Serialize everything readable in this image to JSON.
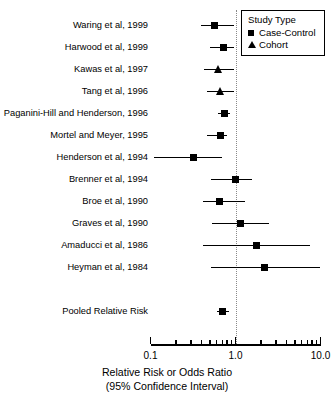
{
  "chart_data": {
    "type": "scatter",
    "plot_kind": "forest-plot",
    "title": "",
    "xlabel": "Relative Risk or Odds Ratio",
    "xlabel_sub": "(95% Confidence Interval)",
    "ylabel": "",
    "xscale": "log",
    "xlim": [
      0.1,
      10.0
    ],
    "grid": false,
    "reference_line": 1.0,
    "tick_labels": [
      "0.1",
      "1.0",
      "10.0"
    ],
    "tick_values": [
      0.1,
      1.0,
      10.0
    ],
    "minor_tick_values": [
      0.2,
      0.3,
      0.4,
      0.5,
      0.6,
      0.7,
      0.8,
      0.9,
      2,
      3,
      4,
      5,
      6,
      7,
      8,
      9
    ],
    "legend": {
      "title": "Study Type",
      "position": "top-right",
      "entries": [
        {
          "label": "Case-Control",
          "marker": "square"
        },
        {
          "label": "Cohort",
          "marker": "triangle"
        }
      ]
    },
    "categories": [
      "Waring et al,  1999",
      "Harwood et al,  1999",
      "Kawas et al,  1997",
      "Tang et al,  1996",
      "Paganini-Hill and Henderson,  1996",
      "Mortel and Meyer,  1995",
      "Henderson et al,  1994",
      "Brenner et al,  1994",
      "Broe et al,  1990",
      "Graves et al,  1990",
      "Amaducci et al,  1986",
      "Heyman et al, 1984",
      "Pooled Relative Risk"
    ],
    "points": [
      {
        "label": "Waring et al,  1999",
        "study": "Waring et al",
        "year": 1999,
        "estimate": 0.57,
        "ci_low": 0.39,
        "ci_high": 0.95,
        "marker": "square",
        "study_type": "Case-Control"
      },
      {
        "label": "Harwood et al,  1999",
        "study": "Harwood et al",
        "year": 1999,
        "estimate": 0.72,
        "ci_low": 0.5,
        "ci_high": 0.97,
        "marker": "square",
        "study_type": "Case-Control"
      },
      {
        "label": "Kawas et al,  1997",
        "study": "Kawas et al",
        "year": 1997,
        "estimate": 0.63,
        "ci_low": 0.43,
        "ci_high": 0.97,
        "marker": "triangle",
        "study_type": "Cohort"
      },
      {
        "label": "Tang et al,  1996",
        "study": "Tang et al",
        "year": 1996,
        "estimate": 0.66,
        "ci_low": 0.46,
        "ci_high": 0.95,
        "marker": "triangle",
        "study_type": "Cohort"
      },
      {
        "label": "Paganini-Hill and Henderson,  1996",
        "study": "Paganini-Hill and Henderson",
        "year": 1996,
        "estimate": 0.74,
        "ci_low": 0.63,
        "ci_high": 0.87,
        "marker": "square",
        "study_type": "Case-Control"
      },
      {
        "label": "Mortel and Meyer,  1995",
        "study": "Mortel and Meyer",
        "year": 1995,
        "estimate": 0.66,
        "ci_low": 0.46,
        "ci_high": 0.8,
        "marker": "square",
        "study_type": "Case-Control"
      },
      {
        "label": "Henderson et al,  1994",
        "study": "Henderson et al",
        "year": 1994,
        "estimate": 0.32,
        "ci_low": 0.11,
        "ci_high": 0.7,
        "marker": "square",
        "study_type": "Case-Control"
      },
      {
        "label": "Brenner et al,  1994",
        "study": "Brenner et al",
        "year": 1994,
        "estimate": 1.0,
        "ci_low": 0.52,
        "ci_high": 1.55,
        "marker": "square",
        "study_type": "Case-Control"
      },
      {
        "label": "Broe et al,  1990",
        "study": "Broe et al",
        "year": 1990,
        "estimate": 0.65,
        "ci_low": 0.42,
        "ci_high": 1.29,
        "marker": "square",
        "study_type": "Case-Control"
      },
      {
        "label": "Graves et al,  1990",
        "study": "Graves et al",
        "year": 1990,
        "estimate": 1.15,
        "ci_low": 0.53,
        "ci_high": 2.5,
        "marker": "square",
        "study_type": "Case-Control"
      },
      {
        "label": "Amaducci et al,  1986",
        "study": "Amaducci et al",
        "year": 1986,
        "estimate": 1.75,
        "ci_low": 0.41,
        "ci_high": 7.6,
        "marker": "square",
        "study_type": "Case-Control"
      },
      {
        "label": "Heyman et al, 1984",
        "study": "Heyman et al",
        "year": 1984,
        "estimate": 2.2,
        "ci_low": 0.52,
        "ci_high": 10.0,
        "marker": "square",
        "study_type": "Case-Control"
      },
      {
        "label": "Pooled Relative Risk",
        "study": "Pooled Relative Risk",
        "year": null,
        "estimate": 0.7,
        "ci_low": 0.61,
        "ci_high": 0.83,
        "marker": "square",
        "study_type": "Pooled"
      }
    ]
  }
}
